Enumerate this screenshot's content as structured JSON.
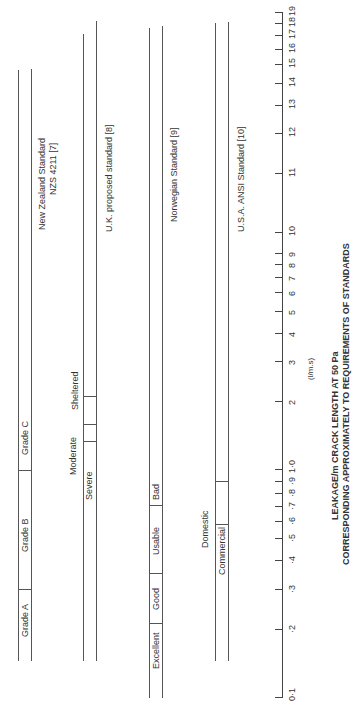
{
  "chart_data": {
    "type": "bar",
    "orientation": "rotated -90deg (horizontal range bars, log x-axis)",
    "title": "LEAKAGE/m CRACK LENGTH AT 50 Pa",
    "subtitle": "CORRESPONDING APPROXIMATELY TO REQUIREMENTS OF STANDARDS",
    "xlabel": "(l/m.s)",
    "axis_ticks": [
      "0·1",
      "·2",
      "·3",
      "·4",
      "·5",
      "·6",
      "·7",
      "·8",
      "·9",
      "1·0",
      "2",
      "3",
      "4",
      "5",
      "6",
      "7",
      "8",
      "9",
      "10",
      "11",
      "12",
      "13",
      "14",
      "15",
      "16",
      "17",
      "18",
      "19"
    ],
    "series": [
      {
        "name": "New Zealand Standard NZS 4211 [7]",
        "segments": [
          {
            "label": "Grade A",
            "from": 0.15,
            "to": 0.3
          },
          {
            "label": "Grade B",
            "from": 0.3,
            "to": 1.0
          },
          {
            "label": "Grade C",
            "from": 1.0,
            "to": 14
          }
        ]
      },
      {
        "name": "U.K. proposed standard [8]",
        "segments": [
          {
            "label": "Severe",
            "from": 0.15,
            "to": 1.4
          },
          {
            "label": "Moderate",
            "from": 1.4,
            "to": 1.6
          },
          {
            "label": "Sheltered",
            "from": 1.6,
            "to": 2.1
          },
          {
            "label": "",
            "from": 2.1,
            "to": 18
          }
        ]
      },
      {
        "name": "Norwegian Standard [9]",
        "segments": [
          {
            "label": "Excellent",
            "from": 0.1,
            "to": 0.2
          },
          {
            "label": "Good",
            "from": 0.2,
            "to": 0.35
          },
          {
            "label": "Usable",
            "from": 0.35,
            "to": 0.7
          },
          {
            "label": "Bad",
            "from": 0.7,
            "to": 17.5
          }
        ]
      },
      {
        "name": "U.S.A. ANSI Standard [10]",
        "segments": [
          {
            "label": "Commercial",
            "from": 0.15,
            "to": 0.6
          },
          {
            "label": "Domestic",
            "from": 0.6,
            "to": 0.9
          },
          {
            "label": "",
            "from": 0.9,
            "to": 18
          }
        ]
      }
    ]
  },
  "labels": {
    "nz_name": "New Zealand Standard",
    "nz_ref": "NZS 4211 [7]",
    "uk_name": "U.K. proposed standard [8]",
    "nor_name": "Norwegian Standard [9]",
    "usa_name": "U.S.A. ANSI Standard [10]",
    "grade_a": "Grade A",
    "grade_b": "Grade B",
    "grade_c": "Grade C",
    "severe": "Severe",
    "moderate": "Moderate",
    "sheltered": "Sheltered",
    "excellent": "Excellent",
    "good": "Good",
    "usable": "Usable",
    "bad": "Bad",
    "commercial": "Commercial",
    "domestic": "Domestic",
    "unit": "(l/m.s)",
    "title1": "LEAKAGE/m CRACK LENGTH AT 50 Pa",
    "title2": "CORRESPONDING APPROXIMATELY TO REQUIREMENTS OF STANDARDS"
  },
  "ticks": [
    {
      "label": "0·1",
      "y": 697
    },
    {
      "label": "·2",
      "y": 629
    },
    {
      "label": "·3",
      "y": 589
    },
    {
      "label": "·4",
      "y": 560
    },
    {
      "label": "·5",
      "y": 538
    },
    {
      "label": "·6",
      "y": 521
    },
    {
      "label": "·7",
      "y": 506
    },
    {
      "label": "·8",
      "y": 493
    },
    {
      "label": "·9",
      "y": 481
    },
    {
      "label": "1·0",
      "y": 469
    },
    {
      "label": "2",
      "y": 401
    },
    {
      "label": "3",
      "y": 361
    },
    {
      "label": "4",
      "y": 333
    },
    {
      "label": "5",
      "y": 311
    },
    {
      "label": "6",
      "y": 292
    },
    {
      "label": "7",
      "y": 277
    },
    {
      "label": "8",
      "y": 264
    },
    {
      "label": "9",
      "y": 253
    },
    {
      "label": "10",
      "y": 232
    },
    {
      "label": "11",
      "y": 173
    },
    {
      "label": "12",
      "y": 133
    },
    {
      "label": "13",
      "y": 105
    },
    {
      "label": "14",
      "y": 83
    },
    {
      "label": "15",
      "y": 64
    },
    {
      "label": "16",
      "y": 49
    },
    {
      "label": "17",
      "y": 35
    },
    {
      "label": "18",
      "y": 23
    },
    {
      "label": "19",
      "y": 12
    }
  ]
}
